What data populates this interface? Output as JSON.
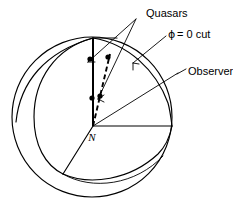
{
  "figure": {
    "type": "schematic-diagram",
    "background_color": "#ffffff",
    "line_color": "#000000"
  },
  "labels": {
    "quasars": "Quasars",
    "phi_cut": "ϕ = 0  cut",
    "phi_symbol": "ϕ",
    "phi_equation": "= 0  cut",
    "observer": "Observer",
    "center_node": "N"
  },
  "geometry": {
    "sphere": {
      "center_x": 92,
      "center_y": 117,
      "radius": 80
    },
    "node_N": {
      "x": 93,
      "y": 126
    },
    "north_pole": {
      "x": 93,
      "y": 38
    },
    "quasar_points": [
      {
        "x": 90,
        "y": 59
      },
      {
        "x": 108,
        "y": 57
      },
      {
        "x": 92,
        "y": 98
      },
      {
        "x": 100,
        "y": 96
      }
    ],
    "equator_endpoint": {
      "x": 172,
      "y": 126
    },
    "wedge_corner": {
      "x": 63,
      "y": 174
    }
  },
  "annotations": [
    {
      "name": "quasars",
      "anchor_x": 137,
      "anchor_y": 18
    },
    {
      "name": "phi-cut",
      "anchor_x": 170,
      "anchor_y": 40
    },
    {
      "name": "observer",
      "anchor_x": 180,
      "anchor_y": 76
    }
  ]
}
